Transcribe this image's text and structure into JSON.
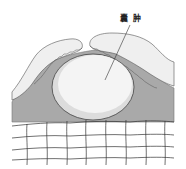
{
  "diagram": {
    "label": "囊 肿",
    "colors": {
      "background": "#ffffff",
      "tissue_gray": "#a9a9a9",
      "skin_fold": "#efefef",
      "cyst_fill": "#f4f4f4",
      "cyst_shadow": "#dcdcdc",
      "outline": "#555555",
      "cell_line": "#333333"
    }
  }
}
